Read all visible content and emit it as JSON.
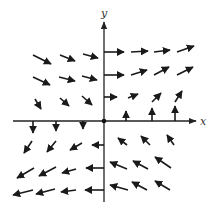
{
  "diagram": {
    "type": "vector-field",
    "axes": {
      "x_label": "x",
      "y_label": "y",
      "origin_marked": true,
      "color": "#222222"
    },
    "arrow_color": "#1a1a1a",
    "vectors": [
      {
        "quadrant": "II",
        "x": 33,
        "y": 55,
        "dx": 18,
        "dy": 9
      },
      {
        "quadrant": "II",
        "x": 60,
        "y": 55,
        "dx": 15,
        "dy": 6
      },
      {
        "quadrant": "II",
        "x": 83,
        "y": 54,
        "dx": 15,
        "dy": 4
      },
      {
        "quadrant": "II",
        "x": 33,
        "y": 77,
        "dx": 17,
        "dy": 8
      },
      {
        "quadrant": "II",
        "x": 59,
        "y": 77,
        "dx": 16,
        "dy": 4
      },
      {
        "quadrant": "II",
        "x": 82,
        "y": 76,
        "dx": 15,
        "dy": 4
      },
      {
        "quadrant": "II",
        "x": 35,
        "y": 99,
        "dx": 6,
        "dy": 10
      },
      {
        "quadrant": "II",
        "x": 60,
        "y": 98,
        "dx": 9,
        "dy": 8
      },
      {
        "quadrant": "II",
        "x": 82,
        "y": 96,
        "dx": 10,
        "dy": 9
      },
      {
        "quadrant": "I",
        "x": 104,
        "y": 52,
        "dx": 20,
        "dy": 0
      },
      {
        "quadrant": "I",
        "x": 131,
        "y": 52,
        "dx": 17,
        "dy": -1
      },
      {
        "quadrant": "I",
        "x": 154,
        "y": 52,
        "dx": 16,
        "dy": -2
      },
      {
        "quadrant": "I",
        "x": 177,
        "y": 52,
        "dx": 17,
        "dy": -6
      },
      {
        "quadrant": "I",
        "x": 104,
        "y": 75,
        "dx": 20,
        "dy": 0
      },
      {
        "quadrant": "I",
        "x": 131,
        "y": 75,
        "dx": 16,
        "dy": -5
      },
      {
        "quadrant": "I",
        "x": 154,
        "y": 75,
        "dx": 15,
        "dy": -8
      },
      {
        "quadrant": "I",
        "x": 177,
        "y": 75,
        "dx": 16,
        "dy": -8
      },
      {
        "quadrant": "I",
        "x": 104,
        "y": 97,
        "dx": 13,
        "dy": 0
      },
      {
        "quadrant": "I",
        "x": 128,
        "y": 98,
        "dx": 10,
        "dy": -4
      },
      {
        "quadrant": "I",
        "x": 152,
        "y": 102,
        "dx": 9,
        "dy": -9
      },
      {
        "quadrant": "I",
        "x": 175,
        "y": 102,
        "dx": 7,
        "dy": -11
      },
      {
        "quadrant": "x-axis",
        "x": 126,
        "y": 121,
        "dx": 0,
        "dy": -10
      },
      {
        "quadrant": "x-axis",
        "x": 152,
        "y": 121,
        "dx": 0,
        "dy": -13
      },
      {
        "quadrant": "x-axis",
        "x": 175,
        "y": 121,
        "dx": 0,
        "dy": -15
      },
      {
        "quadrant": "x-axis",
        "x": 33,
        "y": 121,
        "dx": 0,
        "dy": 12
      },
      {
        "quadrant": "x-axis",
        "x": 56,
        "y": 121,
        "dx": 0,
        "dy": 10
      },
      {
        "quadrant": "x-axis",
        "x": 83,
        "y": 121,
        "dx": 0,
        "dy": 8
      },
      {
        "quadrant": "III",
        "x": 32,
        "y": 141,
        "dx": -8,
        "dy": 12
      },
      {
        "quadrant": "III",
        "x": 56,
        "y": 141,
        "dx": -9,
        "dy": 11
      },
      {
        "quadrant": "III",
        "x": 82,
        "y": 143,
        "dx": -12,
        "dy": 7
      },
      {
        "quadrant": "III",
        "x": 104,
        "y": 145,
        "dx": -12,
        "dy": 0
      },
      {
        "quadrant": "III",
        "x": 34,
        "y": 168,
        "dx": -17,
        "dy": 10
      },
      {
        "quadrant": "III",
        "x": 56,
        "y": 167,
        "dx": -17,
        "dy": 9
      },
      {
        "quadrant": "III",
        "x": 76,
        "y": 169,
        "dx": -14,
        "dy": 4
      },
      {
        "quadrant": "III",
        "x": 104,
        "y": 168,
        "dx": -18,
        "dy": 0
      },
      {
        "quadrant": "III",
        "x": 33,
        "y": 190,
        "dx": -20,
        "dy": 5
      },
      {
        "quadrant": "III",
        "x": 55,
        "y": 189,
        "dx": -19,
        "dy": 5
      },
      {
        "quadrant": "III",
        "x": 76,
        "y": 190,
        "dx": -15,
        "dy": 2
      },
      {
        "quadrant": "III",
        "x": 104,
        "y": 190,
        "dx": -19,
        "dy": 0
      },
      {
        "quadrant": "IV",
        "x": 127,
        "y": 145,
        "dx": -9,
        "dy": -7
      },
      {
        "quadrant": "IV",
        "x": 150,
        "y": 145,
        "dx": -9,
        "dy": -9
      },
      {
        "quadrant": "IV",
        "x": 174,
        "y": 145,
        "dx": -7,
        "dy": -10
      },
      {
        "quadrant": "IV",
        "x": 127,
        "y": 169,
        "dx": -17,
        "dy": -7
      },
      {
        "quadrant": "IV",
        "x": 148,
        "y": 169,
        "dx": -15,
        "dy": -8
      },
      {
        "quadrant": "IV",
        "x": 171,
        "y": 168,
        "dx": -16,
        "dy": -11
      },
      {
        "quadrant": "IV",
        "x": 128,
        "y": 190,
        "dx": -18,
        "dy": -5
      },
      {
        "quadrant": "IV",
        "x": 147,
        "y": 190,
        "dx": -15,
        "dy": -8
      },
      {
        "quadrant": "IV",
        "x": 170,
        "y": 190,
        "dx": -15,
        "dy": -9
      }
    ]
  }
}
